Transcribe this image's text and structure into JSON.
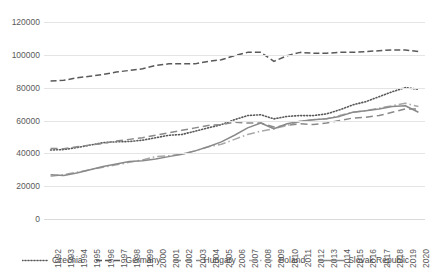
{
  "chart_data": {
    "type": "line",
    "title": "",
    "xlabel": "",
    "ylabel": "",
    "ylim": [
      0,
      120000
    ],
    "ytick_step": 20000,
    "yticks": [
      "0",
      "20000",
      "40000",
      "60000",
      "80000",
      "100000",
      "120000"
    ],
    "grid": true,
    "legend_position": "bottom",
    "categories": [
      "1992",
      "1993",
      "1994",
      "1995",
      "1996",
      "1997",
      "1998",
      "1999",
      "2000",
      "2001",
      "2002",
      "2003",
      "2004",
      "2005",
      "2006",
      "2007",
      "2008",
      "2009",
      "2010",
      "2011",
      "2012",
      "2013",
      "2014",
      "2015",
      "2016",
      "2017",
      "2018",
      "2019",
      "2020"
    ],
    "series": [
      {
        "name": "Czechia",
        "style": "dotted",
        "color": "#595959",
        "values": [
          42000,
          42300,
          43500,
          45000,
          46500,
          47000,
          47200,
          48000,
          49500,
          51000,
          51500,
          53500,
          55500,
          57500,
          60500,
          63000,
          63500,
          61000,
          62500,
          63000,
          63000,
          64000,
          66500,
          69500,
          71500,
          74500,
          77500,
          80000,
          79000
        ]
      },
      {
        "name": "Germany",
        "style": "dashed",
        "color": "#595959",
        "values": [
          84000,
          84500,
          86000,
          87000,
          88000,
          89500,
          90500,
          91500,
          93500,
          94500,
          94500,
          94500,
          96000,
          97000,
          99500,
          101500,
          101500,
          96000,
          99500,
          101500,
          101000,
          101000,
          101500,
          101500,
          102000,
          102500,
          103000,
          103000,
          102000
        ]
      },
      {
        "name": "Hungary",
        "style": "longdash",
        "color": "#8a8a8a",
        "values": [
          43000,
          42800,
          44000,
          45000,
          46000,
          47500,
          48500,
          49500,
          51000,
          52500,
          54000,
          55500,
          57000,
          57500,
          59000,
          58500,
          58500,
          56000,
          57000,
          58000,
          57500,
          58500,
          60000,
          61500,
          62000,
          63000,
          65000,
          67000,
          67000
        ]
      },
      {
        "name": "Poland",
        "style": "dashdot",
        "color": "#a8a8a8",
        "values": [
          26000,
          27000,
          28500,
          30000,
          31500,
          33000,
          34500,
          36000,
          38000,
          38500,
          39500,
          41500,
          44000,
          45500,
          48500,
          51500,
          53500,
          55000,
          57000,
          59500,
          60500,
          61000,
          63000,
          65000,
          66000,
          67500,
          69000,
          70500,
          68500
        ]
      },
      {
        "name": "Slovak Republic",
        "style": "solid",
        "color": "#8a8a8a",
        "values": [
          27000,
          26500,
          28000,
          30000,
          32000,
          33500,
          35000,
          35500,
          36500,
          38000,
          39500,
          41500,
          44000,
          47000,
          51000,
          55500,
          58500,
          55000,
          58000,
          59500,
          60500,
          61000,
          62500,
          65000,
          66000,
          67000,
          68500,
          69000,
          65000
        ]
      }
    ]
  }
}
